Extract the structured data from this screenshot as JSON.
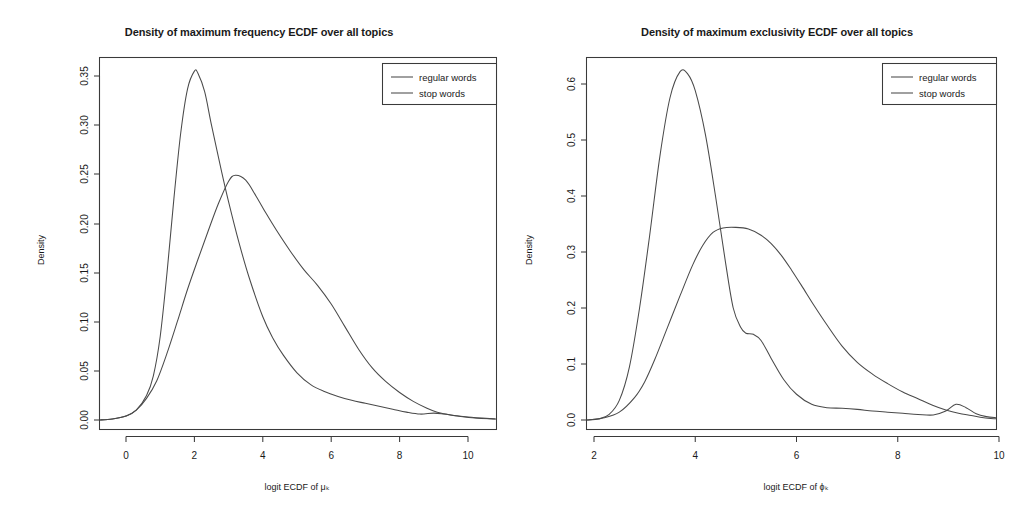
{
  "figure": {
    "background": "#ffffff",
    "ink_color": "#3a3a3a",
    "curve_color": "#4a4a4a"
  },
  "chart_data": [
    {
      "type": "line",
      "panel": "left",
      "title": "Density of maximum frequency ECDF over all topics",
      "xlabel": "logit ECDF of μₖ",
      "ylabel": "Density",
      "xlim": [
        -0.8,
        10.8
      ],
      "ylim": [
        -0.012,
        0.375
      ],
      "xticks": [
        0,
        2,
        4,
        6,
        8,
        10
      ],
      "xticklabels": [
        "0",
        "2",
        "4",
        "6",
        "8",
        "10"
      ],
      "yticks": [
        0.0,
        0.05,
        0.1,
        0.15,
        0.2,
        0.25,
        0.3,
        0.35
      ],
      "yticklabels": [
        "0.00",
        "0.05",
        "0.10",
        "0.15",
        "0.20",
        "0.25",
        "0.30",
        "0.35"
      ],
      "grid": false,
      "legend_position": "top-right",
      "series": [
        {
          "name": "regular words",
          "x": [
            -0.8,
            -0.4,
            0.0,
            0.3,
            0.6,
            0.8,
            1.0,
            1.2,
            1.4,
            1.6,
            1.8,
            2.0,
            2.1,
            2.3,
            2.5,
            2.8,
            3.0,
            3.3,
            3.6,
            4.0,
            4.3,
            4.6,
            5.0,
            5.4,
            5.8,
            6.2,
            6.6,
            7.0,
            7.4,
            7.8,
            8.2,
            8.6,
            9.0,
            9.3,
            9.7,
            10.2,
            10.8
          ],
          "y": [
            0.0,
            0.001,
            0.004,
            0.01,
            0.025,
            0.045,
            0.085,
            0.15,
            0.225,
            0.292,
            0.337,
            0.355,
            0.353,
            0.334,
            0.3,
            0.252,
            0.222,
            0.181,
            0.145,
            0.105,
            0.083,
            0.066,
            0.048,
            0.036,
            0.029,
            0.024,
            0.02,
            0.017,
            0.014,
            0.011,
            0.008,
            0.006,
            0.007,
            0.006,
            0.004,
            0.002,
            0.001
          ]
        },
        {
          "name": "stop words",
          "x": [
            -0.8,
            -0.4,
            0.0,
            0.3,
            0.6,
            0.9,
            1.2,
            1.5,
            1.8,
            2.1,
            2.4,
            2.7,
            3.0,
            3.2,
            3.5,
            3.8,
            4.1,
            4.4,
            4.8,
            5.2,
            5.6,
            6.0,
            6.4,
            6.8,
            7.2,
            7.6,
            8.0,
            8.4,
            8.8,
            9.1,
            9.5,
            10.0,
            10.8
          ],
          "y": [
            0.0,
            0.001,
            0.004,
            0.01,
            0.022,
            0.04,
            0.068,
            0.1,
            0.133,
            0.163,
            0.192,
            0.22,
            0.243,
            0.249,
            0.244,
            0.228,
            0.21,
            0.193,
            0.172,
            0.153,
            0.137,
            0.118,
            0.095,
            0.072,
            0.053,
            0.039,
            0.028,
            0.019,
            0.012,
            0.008,
            0.005,
            0.003,
            0.001
          ]
        }
      ]
    },
    {
      "type": "line",
      "panel": "right",
      "title": "Density of maximum exclusivity ECDF over all topics",
      "xlabel": "logit ECDF of ϕₖ",
      "ylabel": "Density",
      "xlim": [
        1.85,
        9.95
      ],
      "ylim": [
        -0.02,
        0.66
      ],
      "xticks": [
        2,
        4,
        6,
        8,
        10
      ],
      "xticklabels": [
        "2",
        "4",
        "6",
        "8",
        "10"
      ],
      "yticks": [
        0.0,
        0.1,
        0.2,
        0.3,
        0.4,
        0.5,
        0.6
      ],
      "yticklabels": [
        "0.0",
        "0.1",
        "0.2",
        "0.3",
        "0.4",
        "0.5",
        "0.6"
      ],
      "grid": false,
      "legend_position": "top-right",
      "series": [
        {
          "name": "regular words",
          "x": [
            1.85,
            2.1,
            2.3,
            2.5,
            2.7,
            2.9,
            3.1,
            3.3,
            3.5,
            3.7,
            3.85,
            4.0,
            4.2,
            4.4,
            4.6,
            4.75,
            4.9,
            5.0,
            5.15,
            5.3,
            5.5,
            5.75,
            6.0,
            6.3,
            6.6,
            6.9,
            7.2,
            7.5,
            7.8,
            8.1,
            8.4,
            8.7,
            8.95,
            9.15,
            9.35,
            9.55,
            9.75,
            9.95
          ],
          "y": [
            0.0,
            0.002,
            0.01,
            0.035,
            0.095,
            0.2,
            0.33,
            0.47,
            0.575,
            0.622,
            0.618,
            0.588,
            0.51,
            0.4,
            0.28,
            0.2,
            0.165,
            0.155,
            0.153,
            0.142,
            0.11,
            0.072,
            0.046,
            0.028,
            0.022,
            0.021,
            0.019,
            0.016,
            0.014,
            0.012,
            0.01,
            0.009,
            0.016,
            0.028,
            0.022,
            0.011,
            0.006,
            0.004
          ]
        },
        {
          "name": "stop words",
          "x": [
            1.85,
            2.2,
            2.5,
            2.8,
            3.0,
            3.2,
            3.45,
            3.7,
            3.95,
            4.15,
            4.35,
            4.55,
            4.8,
            5.05,
            5.3,
            5.5,
            5.7,
            5.9,
            6.1,
            6.35,
            6.6,
            6.9,
            7.2,
            7.5,
            7.8,
            8.1,
            8.4,
            8.7,
            8.95,
            9.2,
            9.45,
            9.7,
            9.95
          ],
          "y": [
            0.0,
            0.004,
            0.014,
            0.04,
            0.068,
            0.108,
            0.165,
            0.222,
            0.277,
            0.312,
            0.335,
            0.343,
            0.344,
            0.341,
            0.33,
            0.315,
            0.294,
            0.268,
            0.24,
            0.204,
            0.17,
            0.132,
            0.103,
            0.082,
            0.065,
            0.05,
            0.038,
            0.026,
            0.018,
            0.012,
            0.008,
            0.004,
            0.002
          ]
        }
      ]
    }
  ],
  "legend": {
    "entries": [
      {
        "label": "regular words"
      },
      {
        "label": "stop words"
      }
    ]
  }
}
